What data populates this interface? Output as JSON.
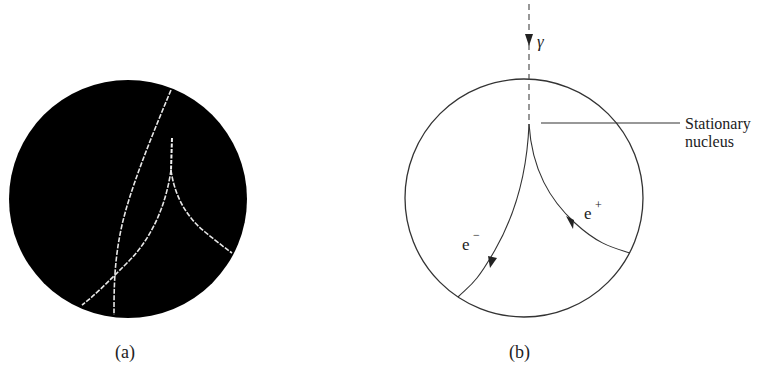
{
  "panel_a": {
    "caption": "(a)",
    "background": "#000000",
    "track_color": "#e8e8e8"
  },
  "panel_b": {
    "caption": "(b)",
    "photon_label": "γ",
    "nucleus_label_line1": "Stationary",
    "nucleus_label_line2": "nucleus",
    "electron_label": "e",
    "electron_sup": "−",
    "positron_label": "e",
    "positron_sup": "+"
  }
}
